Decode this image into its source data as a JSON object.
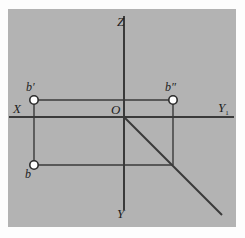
{
  "figure": {
    "background_color": "#b0b0b0",
    "page_color": "#fdfdfd",
    "line_color": "#3a3a3a",
    "label_color": "#1d1d1d",
    "point_fill_color": "#ffffff",
    "panel": {
      "x": 8,
      "y": 9,
      "width": 228,
      "height": 218
    }
  },
  "axes": [
    {
      "name": "z-axis",
      "label": "Z",
      "label_x": 117,
      "label_y": 26,
      "orientation": "vertical-up",
      "x1": 124,
      "y1": 16,
      "x2": 124,
      "y2": 117
    },
    {
      "name": "y-axis",
      "label": "Y",
      "label_x": 117,
      "label_y": 218,
      "orientation": "vertical-down",
      "x1": 124,
      "y1": 117,
      "x2": 124,
      "y2": 210
    },
    {
      "name": "x-axis",
      "label": "X",
      "label_x": 13,
      "label_y": 113,
      "orientation": "horizontal-left",
      "x1": 9,
      "y1": 117,
      "x2": 124,
      "y2": 117
    },
    {
      "name": "y1-axis",
      "label": "Y",
      "label_sub": "1",
      "label_x": 218,
      "label_y": 112,
      "orientation": "horizontal-right",
      "x1": 124,
      "y1": 117,
      "x2": 234,
      "y2": 117
    }
  ],
  "origin": {
    "name": "origin",
    "label": "O",
    "label_x": 111,
    "label_y": 114,
    "x": 124,
    "y": 117
  },
  "points": [
    {
      "name": "b-prime",
      "label": "b",
      "prime": "′",
      "cx": 34,
      "cy": 100,
      "r": 4,
      "label_x": 26,
      "label_y": 91
    },
    {
      "name": "b-double-prime",
      "label": "b",
      "prime": "″",
      "cx": 173,
      "cy": 100,
      "r": 4,
      "label_x": 166,
      "label_y": 91
    },
    {
      "name": "b-plain",
      "label": "b",
      "prime": "",
      "cx": 34,
      "cy": 165,
      "r": 4,
      "label_x": 26,
      "label_y": 177
    }
  ],
  "projection_lines": [
    {
      "name": "upper-horizontal-projection-line",
      "x1": 34,
      "y1": 100,
      "x2": 173,
      "y2": 100
    },
    {
      "name": "left-vertical-projection-line",
      "x1": 34,
      "y1": 100,
      "x2": 34,
      "y2": 165
    },
    {
      "name": "right-vertical-projection-line",
      "x1": 173,
      "y1": 100,
      "x2": 173,
      "y2": 165
    },
    {
      "name": "lower-horizontal-projection-line",
      "x1": 34,
      "y1": 165,
      "x2": 173,
      "y2": 165
    }
  ],
  "bisector": {
    "name": "forty-five-degree-bisector",
    "x1": 124,
    "y1": 117,
    "x2": 222,
    "y2": 215
  }
}
